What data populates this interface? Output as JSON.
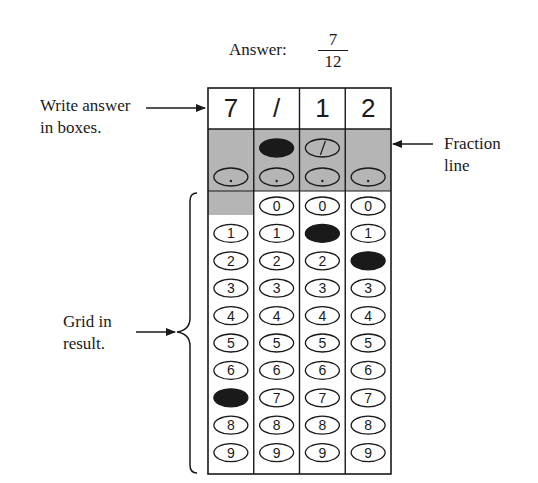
{
  "answer": {
    "label": "Answer:",
    "fraction": {
      "numerator": "7",
      "denominator": "12"
    }
  },
  "annotations": {
    "write_answer": [
      "Write answer",
      "in boxes."
    ],
    "fraction_line": [
      "Fraction",
      "line"
    ],
    "grid_in": [
      "Grid in",
      "result."
    ]
  },
  "grid": {
    "columns": 4,
    "boxes": [
      "7",
      "/",
      "1",
      "2"
    ],
    "fraction_bubble_columns": [
      1,
      2
    ],
    "fraction_bubble_filled": [
      1
    ],
    "fraction_bubble_glyph": "/",
    "decimal_bubble_glyph": ".",
    "digits": [
      "0",
      "1",
      "2",
      "3",
      "4",
      "5",
      "6",
      "7",
      "8",
      "9"
    ],
    "first_column_has_zero": false,
    "filled_digits": [
      {
        "column": 0,
        "digit": "7"
      },
      {
        "column": 2,
        "digit": "1"
      },
      {
        "column": 3,
        "digit": "2"
      }
    ]
  },
  "colors": {
    "shade": "#b5b5b5",
    "ink": "#1a1a1a",
    "paper": "#ffffff"
  }
}
